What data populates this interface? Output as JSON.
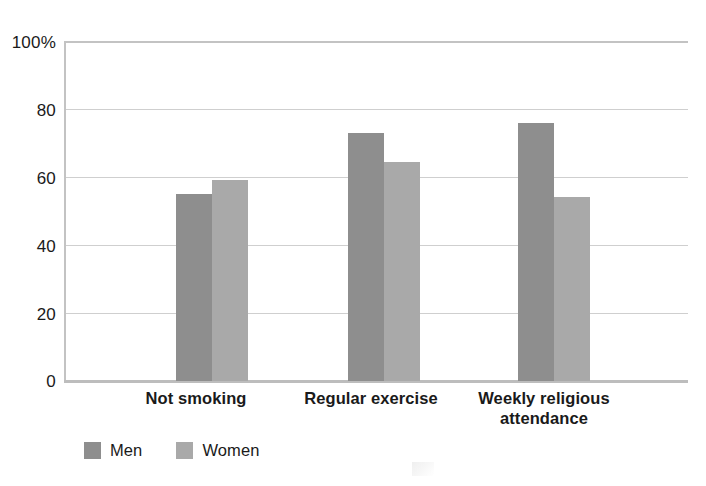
{
  "chart_data": {
    "type": "bar",
    "title": "",
    "subtitle": "",
    "xlabel": "",
    "ylabel": "",
    "ylim": [
      0,
      100
    ],
    "yticks": [
      0,
      20,
      40,
      60,
      80,
      100
    ],
    "ytick_labels": [
      "0",
      "20",
      "40",
      "60",
      "80",
      "100%"
    ],
    "grid": true,
    "grid_axis": "y",
    "legend_position": "bottom-left",
    "categories": [
      "Not smoking",
      "Regular exercise",
      "Weekly religious attendance"
    ],
    "category_label_lines": [
      [
        "Not smoking"
      ],
      [
        "Regular exercise"
      ],
      [
        "Weekly religious",
        "attendance"
      ]
    ],
    "series": [
      {
        "name": "Men",
        "color": "#8e8e8e",
        "values": [
          55,
          73,
          76
        ]
      },
      {
        "name": "Women",
        "color": "#a9a9a9",
        "values": [
          59,
          64.5,
          54
        ]
      }
    ]
  },
  "axis": {
    "y_tick_0": "0",
    "y_tick_20": "20",
    "y_tick_40": "40",
    "y_tick_60": "60",
    "y_tick_80": "80",
    "y_tick_100": "100%"
  },
  "categories": {
    "c0_line0": "Not smoking",
    "c1_line0": "Regular exercise",
    "c2_line0": "Weekly religious",
    "c2_line1": "attendance"
  },
  "legend": {
    "men_label": "Men",
    "women_label": "Women"
  },
  "colors": {
    "men": "#8e8e8e",
    "women": "#a9a9a9",
    "gridline": "#cfcfcf",
    "frame": "#c3c3c3",
    "text": "#1a1a1a",
    "background": "#ffffff"
  }
}
